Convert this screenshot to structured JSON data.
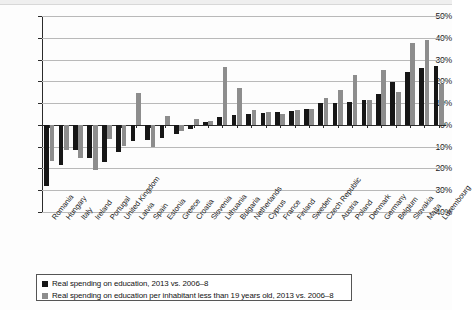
{
  "chart_data": {
    "type": "bar",
    "title": "",
    "subtitle": "",
    "xlabel": "",
    "ylabel": "",
    "ylim": [
      -40,
      50
    ],
    "ytick_values": [
      50,
      40,
      30,
      20,
      10,
      0,
      -10,
      -20,
      -30,
      -40
    ],
    "ytick_labels": [
      "50%",
      "40%",
      "30%",
      "20%",
      "10%",
      "0%",
      "-10%",
      "-20%",
      "-30%",
      "-40%"
    ],
    "grid": true,
    "legend_position": "below-plot",
    "categories": [
      "Romania",
      "Hungary",
      "Italy",
      "Ireland",
      "Portugal",
      "United Kingdom",
      "Latvia",
      "Spain",
      "Estonia",
      "Greece",
      "Croatia",
      "Slovenia",
      "Lithuania",
      "Bulgaria",
      "Netherlands",
      "Cyprus",
      "France",
      "Finland",
      "Sweden",
      "Czech Republic",
      "Austria",
      "Poland",
      "Denmark",
      "Germany",
      "Belgium",
      "Slovakia",
      "Malta",
      "Luxembourg"
    ],
    "series": [
      {
        "name": "Real spending on education, 2013 vs. 2006–8",
        "color": "#161616",
        "values": [
          -28.0,
          -18.5,
          -11.5,
          -15.0,
          -17.0,
          -12.5,
          -7.5,
          -7.0,
          -6.0,
          -4.0,
          -2.0,
          1.5,
          3.5,
          4.5,
          5.0,
          5.5,
          6.0,
          6.5,
          7.5,
          10.0,
          10.0,
          10.5,
          11.5,
          14.0,
          19.5,
          24.5,
          26.0,
          27.0
        ]
      },
      {
        "name": "Real spending on education per inhabitant less than 19 years old, 2013 vs. 2006–8",
        "color": "#8d8d8d",
        "values": [
          -16.5,
          -11.5,
          -15.0,
          -20.5,
          -6.5,
          -9.5,
          14.5,
          -10.0,
          4.0,
          -3.0,
          2.5,
          2.0,
          26.5,
          17.0,
          7.0,
          6.0,
          5.0,
          7.0,
          7.5,
          12.5,
          16.0,
          23.0,
          11.5,
          25.0,
          15.0,
          37.5,
          39.0,
          19.0
        ]
      }
    ]
  },
  "legend": {
    "items": [
      {
        "label": "Real spending on education, 2013 vs. 2006–8",
        "color": "#161616"
      },
      {
        "label": "Real spending on education per inhabitant less than 19 years old, 2013 vs. 2006–8",
        "color": "#8d8d8d"
      }
    ]
  }
}
